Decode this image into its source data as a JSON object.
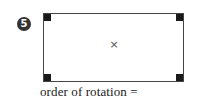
{
  "question": {
    "number": "5",
    "center_symbol": "×",
    "caption": "order of rotation ="
  },
  "colors": {
    "badge_bg": "#333333",
    "corner_fill": "#1a1a1a",
    "border": "#444444"
  }
}
